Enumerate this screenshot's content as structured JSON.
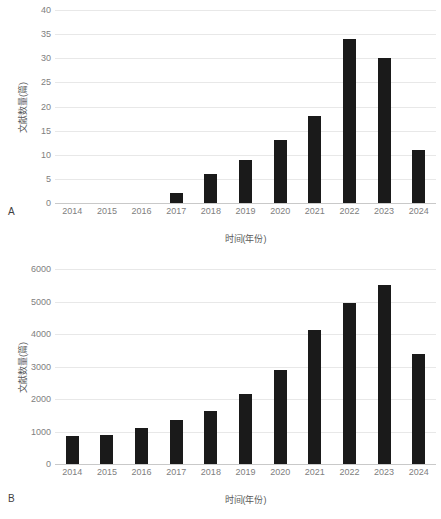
{
  "figure": {
    "background": "#ffffff",
    "bar_color": "#1a1a1a",
    "grid_color": "#e8e8e8",
    "tick_text_color": "#808080",
    "axis_title_color": "#595959"
  },
  "panels": [
    {
      "letter": "A",
      "xlabel": "时间(年份)",
      "ylabel": "文献数量(篇)"
    },
    {
      "letter": "B",
      "xlabel": "时间(年份)",
      "ylabel": "文献数量(篇)"
    }
  ],
  "chart_data": [
    {
      "type": "bar",
      "panel": "A",
      "title": "",
      "xlabel": "时间(年份)",
      "ylabel": "文献数量(篇)",
      "categories": [
        "2014",
        "2015",
        "2016",
        "2017",
        "2018",
        "2019",
        "2020",
        "2021",
        "2022",
        "2023",
        "2024"
      ],
      "values": [
        0,
        0,
        0,
        2,
        6,
        9,
        13,
        18,
        34,
        30,
        11
      ],
      "ylim": [
        0,
        40
      ],
      "yticks": [
        0,
        5,
        10,
        15,
        20,
        25,
        30,
        35,
        40
      ],
      "ytick_labels": [
        "0",
        "5",
        "10",
        "15",
        "20",
        "25",
        "30",
        "35",
        "40"
      ],
      "grid": true,
      "grid_axis": "y",
      "legend": false,
      "bar_color": "#1a1a1a"
    },
    {
      "type": "bar",
      "panel": "B",
      "title": "",
      "xlabel": "时间(年份)",
      "ylabel": "文献数量(篇)",
      "categories": [
        "2014",
        "2015",
        "2016",
        "2017",
        "2018",
        "2019",
        "2020",
        "2021",
        "2022",
        "2023",
        "2024"
      ],
      "values": [
        850,
        880,
        1100,
        1350,
        1620,
        2150,
        2880,
        4120,
        4960,
        5500,
        3380
      ],
      "ylim": [
        0,
        6000
      ],
      "yticks": [
        0,
        1000,
        2000,
        3000,
        4000,
        5000,
        6000
      ],
      "ytick_labels": [
        "0",
        "1000",
        "2000",
        "3000",
        "4000",
        "5000",
        "6000"
      ],
      "grid": true,
      "grid_axis": "y",
      "legend": false,
      "bar_color": "#1a1a1a"
    }
  ]
}
